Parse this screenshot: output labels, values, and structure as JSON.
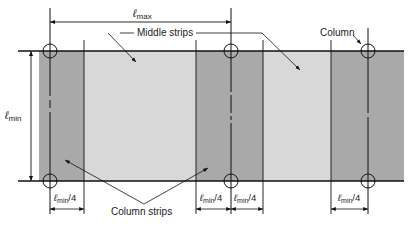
{
  "figure": {
    "colors": {
      "column_strip": "#a9a9a9",
      "middle_strip": "#d8d8d8",
      "line": "#111111",
      "background": "#ffffff"
    }
  },
  "labels": {
    "l_max": {
      "main": "ℓ",
      "sub": "max"
    },
    "l_min": {
      "main": "ℓ",
      "sub": "min"
    },
    "middle_strips": "Middle strips",
    "column": "Column",
    "column_strips": "Column strips",
    "quarter_dims": [
      {
        "main": "ℓ",
        "sub": "min",
        "suffix": "/4"
      },
      {
        "main": "ℓ",
        "sub": "min",
        "suffix": "/4"
      },
      {
        "main": "ℓ",
        "sub": "min",
        "suffix": "/4"
      },
      {
        "main": "ℓ",
        "sub": "min",
        "suffix": "/4"
      }
    ]
  },
  "strips": [
    {
      "type": "column",
      "label": "Column strip"
    },
    {
      "type": "middle",
      "label": "Middle strip"
    },
    {
      "type": "column",
      "label": "Column strip"
    },
    {
      "type": "middle",
      "label": "Middle strip"
    },
    {
      "type": "column",
      "label": "Column strip"
    }
  ],
  "columns": [
    {
      "label": "Column"
    },
    {
      "label": "Column"
    },
    {
      "label": "Column"
    },
    {
      "label": "Column"
    },
    {
      "label": "Column"
    },
    {
      "label": "Column"
    }
  ]
}
